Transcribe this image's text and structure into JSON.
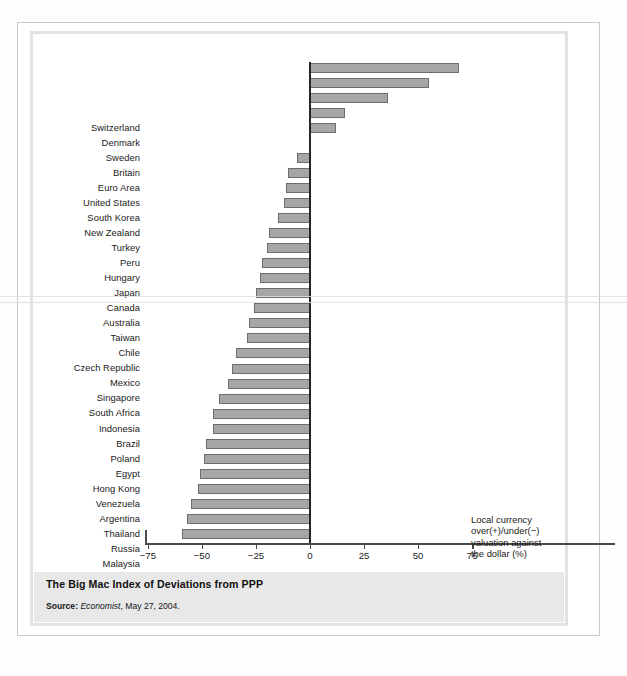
{
  "figure": {
    "caption_title": "The Big Mac Index of Deviations from PPP",
    "source_prefix": "Source:",
    "source_publication": "Economist",
    "source_rest": ", May 27, 2004.",
    "annotation_lines": [
      "Local currency",
      "over(+)/under(−)",
      "valuation against",
      "the dollar (%)"
    ],
    "colors": {
      "bar_fill": "#a6a6a6",
      "bar_border": "#6e6e6e",
      "axis": "#4a4a4a",
      "zero_axis": "#262626",
      "caption_band": "#e8e8e8",
      "frame": "#e2e2e2"
    }
  },
  "chart_data": {
    "type": "bar",
    "orientation": "horizontal",
    "title": "The Big Mac Index of Deviations from PPP",
    "xlabel": "Local currency over(+)/under(−) valuation against the dollar (%)",
    "ylabel": "",
    "xlim": [
      -75,
      75
    ],
    "xticks": [
      -75,
      -50,
      -25,
      0,
      25,
      50,
      75
    ],
    "xticklabels": [
      "−75",
      "−50",
      "−25",
      "0",
      "25",
      "50",
      "75"
    ],
    "grid": false,
    "legend": false,
    "categories": [
      "Switzerland",
      "Denmark",
      "Sweden",
      "Britain",
      "Euro Area",
      "United States",
      "South Korea",
      "New Zealand",
      "Turkey",
      "Peru",
      "Hungary",
      "Japan",
      "Canada",
      "Australia",
      "Taiwan",
      "Chile",
      "Czech Republic",
      "Mexico",
      "Singapore",
      "South Africa",
      "Indonesia",
      "Brazil",
      "Poland",
      "Egypt",
      "Hong Kong",
      "Venezuela",
      "Argentina",
      "Thailand",
      "Russia",
      "Malaysia",
      "China",
      "Philippines"
    ],
    "values": [
      69,
      55,
      36,
      16,
      12,
      0,
      -6,
      -10,
      -11,
      -12,
      -15,
      -19,
      -20,
      -22,
      -23,
      -25,
      -26,
      -28,
      -29,
      -34,
      -36,
      -38,
      -42,
      -45,
      -45,
      -48,
      -49,
      -51,
      -52,
      -55,
      -57,
      -59
    ]
  }
}
